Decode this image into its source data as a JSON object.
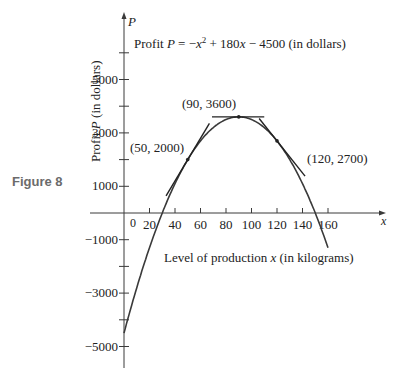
{
  "figure_label": "Figure 8",
  "chart_data": {
    "type": "line",
    "title_parts": {
      "prefix": "Profit ",
      "var": "P",
      "eq": " = −",
      "x": "x",
      "sup": "2",
      "rest": " + 180",
      "x2": "x",
      "tail": " − 4500 (in dollars)"
    },
    "function": {
      "a": -1,
      "b": 180,
      "c": -4500
    },
    "xlabel": "Level of production x (in kilograms)",
    "xlabel_parts": {
      "prefix": "Level of production ",
      "var": "x",
      "suffix": " (in kilograms)"
    },
    "ylabel": "Profit P (in dollars)",
    "ylabel_parts": {
      "prefix": "Profit ",
      "var": "P",
      "suffix": " (in dollars)"
    },
    "x_axis_name": "x",
    "y_axis_name": "P",
    "xlim": [
      -40,
      205
    ],
    "ylim": [
      -6000,
      7600
    ],
    "x_ticks": [
      20,
      40,
      60,
      80,
      100,
      120,
      140,
      160
    ],
    "x_tick_labels": [
      "0",
      "20",
      "40",
      "60",
      "80",
      "100",
      "120",
      "140",
      "160"
    ],
    "y_ticks": [
      -5000,
      -4000,
      -3000,
      -2000,
      -1000,
      1000,
      2000,
      3000,
      4000,
      5000,
      6000
    ],
    "y_tick_labels": [
      "5000",
      "3000",
      "1000",
      "−1000",
      "−3000",
      "−5000"
    ],
    "curve_domain": [
      0,
      160
    ],
    "points": [
      {
        "x": 50,
        "y": 2000,
        "label": "(50, 2000)",
        "slope": 80
      },
      {
        "x": 90,
        "y": 3600,
        "label": "(90, 3600)",
        "slope": 0
      },
      {
        "x": 120,
        "y": 2700,
        "label": "(120, 2700)",
        "slope": -60
      }
    ],
    "grid": false,
    "legend": "none"
  }
}
